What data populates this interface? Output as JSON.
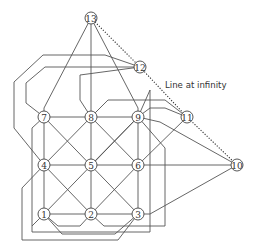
{
  "diagram": {
    "annotation": "Line at infinity",
    "nodes": [
      {
        "id": "1",
        "label": "1",
        "x": 44,
        "y": 214
      },
      {
        "id": "2",
        "label": "2",
        "x": 91,
        "y": 214
      },
      {
        "id": "3",
        "label": "3",
        "x": 138,
        "y": 214
      },
      {
        "id": "4",
        "label": "4",
        "x": 44,
        "y": 165
      },
      {
        "id": "5",
        "label": "5",
        "x": 91,
        "y": 165
      },
      {
        "id": "6",
        "label": "6",
        "x": 138,
        "y": 165
      },
      {
        "id": "7",
        "label": "7",
        "x": 44,
        "y": 117
      },
      {
        "id": "8",
        "label": "8",
        "x": 91,
        "y": 117
      },
      {
        "id": "9",
        "label": "9",
        "x": 138,
        "y": 117
      },
      {
        "id": "10",
        "label": "10",
        "x": 237,
        "y": 165
      },
      {
        "id": "11",
        "label": "11",
        "x": 187,
        "y": 117
      },
      {
        "id": "12",
        "label": "12",
        "x": 140,
        "y": 67
      },
      {
        "id": "13",
        "label": "13",
        "x": 91,
        "y": 18
      }
    ],
    "line_at_infinity": [
      "13",
      "12",
      "11",
      "10"
    ]
  }
}
